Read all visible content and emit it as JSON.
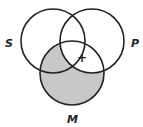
{
  "diagram": {
    "type": "venn-3",
    "labels": {
      "s": "S",
      "p": "P",
      "m": "M"
    },
    "marker": "+",
    "shade_color": "#c8c8c8",
    "stroke_color": "#222222",
    "shaded_regions": [
      "M only",
      "M∩S not P"
    ],
    "marked_region": "S∩P∩M"
  }
}
